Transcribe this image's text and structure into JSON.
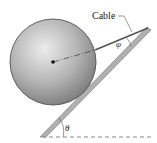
{
  "diagram": {
    "labels": {
      "cable": "Cable",
      "phi": "φ",
      "theta": "θ"
    },
    "colors": {
      "sphere_light": "#e6e6e6",
      "sphere_dark": "#7a7a7a",
      "incline": "#a8a8a8",
      "cable": "#555555",
      "dashed": "#888888"
    }
  }
}
